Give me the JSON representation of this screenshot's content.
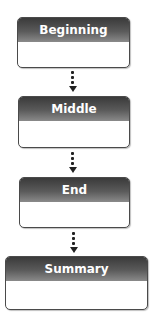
{
  "diagram": {
    "type": "vertical-flowchart",
    "boxes": [
      {
        "title": "Beginning"
      },
      {
        "title": "Middle"
      },
      {
        "title": "End"
      },
      {
        "title": "Summary"
      }
    ],
    "connectors": [
      {
        "from": "Beginning",
        "to": "Middle",
        "style": "dotted-arrow"
      },
      {
        "from": "Middle",
        "to": "End",
        "style": "dotted-arrow"
      },
      {
        "from": "End",
        "to": "Summary",
        "style": "dotted-arrow"
      }
    ],
    "colors": {
      "header": "#4a4a4a",
      "header_text": "#ffffff",
      "body": "#ffffff",
      "border": "#4a4a4a"
    }
  }
}
